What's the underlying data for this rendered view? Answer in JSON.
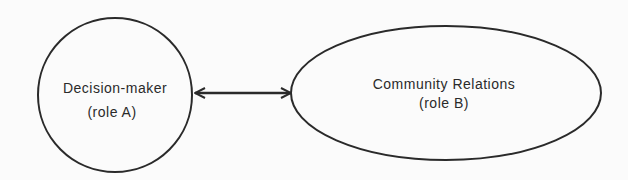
{
  "diagram": {
    "node_a": {
      "line1": "Decision-maker",
      "line2": "(role A)"
    },
    "node_b": {
      "line1": "Community Relations",
      "line2": "(role B)"
    },
    "connector": {
      "type": "bidirectional-arrow"
    },
    "colors": {
      "stroke": "#2a2a2a",
      "background": "#fbfbfb"
    }
  }
}
